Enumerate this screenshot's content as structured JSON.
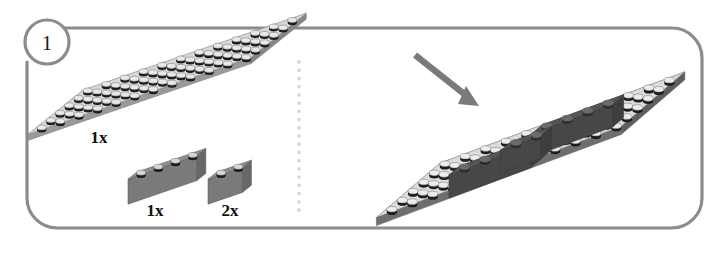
{
  "panel": {
    "step_number": "1",
    "border_color": "#8c8c8c",
    "background_color": "#ffffff",
    "border_radius": 30,
    "border_width": 3.2
  },
  "divider": {
    "name": "dotted-separator",
    "dot_color": "#d8d8d8",
    "orientation": "vertical",
    "x": 299,
    "y_start": 62,
    "y_end": 210,
    "dot_count": 19
  },
  "parts": [
    {
      "id": "base-plate",
      "label": "1x",
      "type": "plate",
      "studs_x": 12,
      "studs_y": 6,
      "top_color": "#d8d8d8",
      "side_color": "#9a9a9a",
      "stud_top_color": "#e8e8e8",
      "stud_side_color": "#1c1c1c"
    },
    {
      "id": "brick-1x4",
      "label": "1x",
      "type": "brick",
      "studs_x": 4,
      "studs_y": 1,
      "top_color": "#8e8e8e",
      "side_color": "#7a7a7a",
      "end_color": "#686868",
      "stud_top_color": "#d6d6d6",
      "stud_side_color": "#1c1c1c"
    },
    {
      "id": "brick-1x2",
      "label": "2x",
      "type": "brick",
      "studs_x": 2,
      "studs_y": 1,
      "top_color": "#8e8e8e",
      "side_color": "#7a7a7a",
      "end_color": "#686868",
      "stud_top_color": "#d6d6d6",
      "stud_side_color": "#1c1c1c"
    }
  ],
  "assembly": {
    "id": "assembled-model",
    "base_plate": {
      "studs_x": 12,
      "studs_y": 6,
      "top_color": "#dcdcdc",
      "side_color": "#6e6e6e",
      "stud_top_color": "#ececec",
      "stud_side_color": "#1c1c1c"
    },
    "placed_bricks_color_top": "#555555",
    "placed_bricks_color_side": "#474747",
    "placed_bricks_color_end": "#3e3e3e",
    "arrow": {
      "name": "placement-arrow",
      "color": "#7a7a7a",
      "direction": "down-right"
    }
  }
}
